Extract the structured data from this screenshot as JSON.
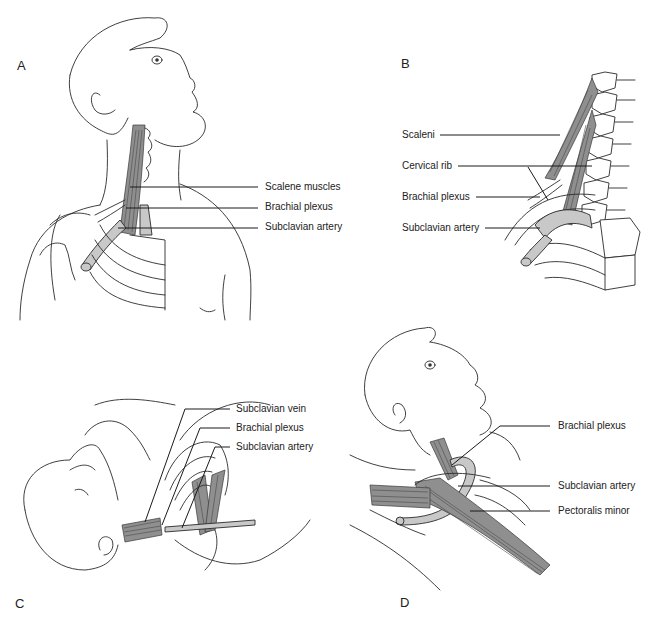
{
  "figure": {
    "panels": [
      {
        "id": "A",
        "letter": "A",
        "labels": [
          "Scalene muscles",
          "Brachial plexus",
          "Subclavian artery"
        ]
      },
      {
        "id": "B",
        "letter": "B",
        "labels": [
          "Scaleni",
          "Cervical rib",
          "Brachial plexus",
          "Subclavian artery"
        ]
      },
      {
        "id": "C",
        "letter": "C",
        "labels": [
          "Subclavian vein",
          "Brachial plexus",
          "Subclavian artery"
        ]
      },
      {
        "id": "D",
        "letter": "D",
        "labels": [
          "Brachial plexus",
          "Subclavian artery",
          "Pectoralis minor"
        ]
      }
    ],
    "colors": {
      "line": "#2a2a2a",
      "muscle": "#8f8f8f",
      "artery": "#c8c8c8",
      "background": "#ffffff"
    }
  }
}
